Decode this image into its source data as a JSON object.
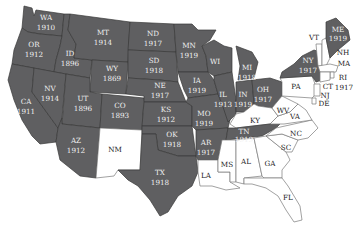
{
  "map": {
    "subject": "U.S. states with women's suffrage before the 19th Amendment",
    "colors": {
      "granted": "#5f5f61",
      "not_granted": "#ffffff",
      "border": "#3a3a3a",
      "label_dark_bg": "#f1f1f1",
      "label_light_bg": "#222222"
    },
    "states": {
      "WA": {
        "abbr": "WA",
        "year": "1910"
      },
      "OR": {
        "abbr": "OR",
        "year": "1912"
      },
      "CA": {
        "abbr": "CA",
        "year": "1911"
      },
      "ID": {
        "abbr": "ID",
        "year": "1896"
      },
      "NV": {
        "abbr": "NV",
        "year": "1914"
      },
      "MT": {
        "abbr": "MT",
        "year": "1914"
      },
      "WY": {
        "abbr": "WY",
        "year": "1869"
      },
      "UT": {
        "abbr": "UT",
        "year": "1896"
      },
      "AZ": {
        "abbr": "AZ",
        "year": "1912"
      },
      "CO": {
        "abbr": "CO",
        "year": "1893"
      },
      "NM": {
        "abbr": "NM",
        "year": ""
      },
      "ND": {
        "abbr": "ND",
        "year": "1917"
      },
      "SD": {
        "abbr": "SD",
        "year": "1918"
      },
      "NE": {
        "abbr": "NE",
        "year": "1917"
      },
      "KS": {
        "abbr": "KS",
        "year": "1912"
      },
      "OK": {
        "abbr": "OK",
        "year": "1918"
      },
      "TX": {
        "abbr": "TX",
        "year": "1918"
      },
      "MN": {
        "abbr": "MN",
        "year": "1919"
      },
      "IA": {
        "abbr": "IA",
        "year": "1919"
      },
      "MO": {
        "abbr": "MO",
        "year": "1919"
      },
      "AR": {
        "abbr": "AR",
        "year": "1917"
      },
      "LA": {
        "abbr": "LA",
        "year": ""
      },
      "WI": {
        "abbr": "WI",
        "year": ""
      },
      "IL": {
        "abbr": "IL",
        "year": "1913"
      },
      "MI": {
        "abbr": "MI",
        "year": "1918"
      },
      "IN": {
        "abbr": "IN",
        "year": "1919"
      },
      "OH": {
        "abbr": "OH",
        "year": "1917"
      },
      "KY": {
        "abbr": "KY",
        "year": ""
      },
      "TN": {
        "abbr": "TN",
        "year": "1919"
      },
      "MS": {
        "abbr": "MS",
        "year": ""
      },
      "AL": {
        "abbr": "AL",
        "year": ""
      },
      "GA": {
        "abbr": "GA",
        "year": ""
      },
      "FL": {
        "abbr": "FL",
        "year": ""
      },
      "SC": {
        "abbr": "SC",
        "year": ""
      },
      "NC": {
        "abbr": "NC",
        "year": ""
      },
      "VA": {
        "abbr": "VA",
        "year": ""
      },
      "WV": {
        "abbr": "WV",
        "year": ""
      },
      "PA": {
        "abbr": "PA",
        "year": ""
      },
      "NY": {
        "abbr": "NY",
        "year": "1917"
      },
      "VT": {
        "abbr": "VT",
        "year": ""
      },
      "NH": {
        "abbr": "NH",
        "year": ""
      },
      "ME": {
        "abbr": "ME",
        "year": "1919"
      },
      "MA": {
        "abbr": "MA",
        "year": ""
      },
      "RI": {
        "abbr": "RI",
        "year": "1917"
      },
      "CT": {
        "abbr": "CT",
        "year": ""
      },
      "NJ": {
        "abbr": "NJ",
        "year": ""
      },
      "DE": {
        "abbr": "DE",
        "year": ""
      }
    }
  }
}
